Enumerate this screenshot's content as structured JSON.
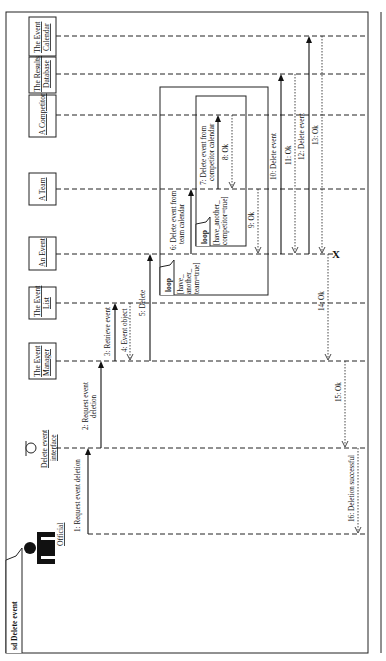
{
  "diagram": {
    "type": "UML sequence diagram",
    "orientation": "rotated 90° counter-clockwise",
    "frame_title": "sd Delete event",
    "lifelines": [
      {
        "id": "official",
        "label": "Official",
        "kind": "actor"
      },
      {
        "id": "interface",
        "label_line1": "Delete event",
        "label_line2": "interface",
        "kind": "boundary"
      },
      {
        "id": "manager",
        "label_line1": "The Event",
        "label_line2": "Manager",
        "kind": "object"
      },
      {
        "id": "list",
        "label_line1": "The Event",
        "label_line2": "List",
        "kind": "object"
      },
      {
        "id": "event",
        "label": "An Event",
        "kind": "object"
      },
      {
        "id": "team",
        "label": "A Team",
        "kind": "object"
      },
      {
        "id": "competitor",
        "label": "A Competitor",
        "kind": "object"
      },
      {
        "id": "results",
        "label_line1": "The Results",
        "label_line2": "Database",
        "kind": "object"
      },
      {
        "id": "calendar",
        "label_line1": "The Event",
        "label_line2": "Calendar",
        "kind": "object"
      }
    ],
    "messages": [
      {
        "n": 1,
        "label": "1: Request event deletion",
        "from": "official",
        "to": "interface",
        "type": "call"
      },
      {
        "n": 2,
        "label_line1": "2: Request event",
        "label_line2": "deletion",
        "from": "interface",
        "to": "manager",
        "type": "call"
      },
      {
        "n": 3,
        "label": "3: Retrieve event",
        "from": "manager",
        "to": "list",
        "type": "call"
      },
      {
        "n": 4,
        "label": "4: Event object",
        "from": "list",
        "to": "manager",
        "type": "return"
      },
      {
        "n": 5,
        "label": "5: Delete",
        "from": "manager",
        "to": "event",
        "type": "call"
      },
      {
        "n": 6,
        "label_line1": "6: Delete event from",
        "label_line2": "team calendar",
        "from": "event",
        "to": "team",
        "type": "call"
      },
      {
        "n": 7,
        "label_line1": "7: Delete event from",
        "label_line2": "competitor calendar",
        "from": "team",
        "to": "competitor",
        "type": "call"
      },
      {
        "n": 8,
        "label": "8: Ok",
        "from": "competitor",
        "to": "team",
        "type": "return"
      },
      {
        "n": 9,
        "label": "9: Ok",
        "from": "team",
        "to": "event",
        "type": "return"
      },
      {
        "n": 10,
        "label": "10: Delete event",
        "from": "event",
        "to": "results",
        "type": "call"
      },
      {
        "n": 11,
        "label": "11: Ok",
        "from": "results",
        "to": "event",
        "type": "return"
      },
      {
        "n": 12,
        "label": "12: Delete event",
        "from": "event",
        "to": "calendar",
        "type": "call"
      },
      {
        "n": 13,
        "label": "13: Ok",
        "from": "calendar",
        "to": "event",
        "type": "return"
      },
      {
        "n": 14,
        "label": "14: Ok",
        "from": "event",
        "to": "manager",
        "type": "return"
      },
      {
        "n": 15,
        "label": "15: Ok",
        "from": "manager",
        "to": "interface",
        "type": "return"
      },
      {
        "n": 16,
        "label": "16: Deletion successful",
        "from": "interface",
        "to": "official",
        "type": "return"
      }
    ],
    "fragments": [
      {
        "kind": "loop",
        "label": "loop",
        "guard_line1": "[have_",
        "guard_line2": "another_",
        "guard_line3": "team=true]"
      },
      {
        "kind": "loop",
        "label": "loop",
        "guard_line1": "[have_another_",
        "guard_line2": "competitor=true]"
      }
    ],
    "destroy_marker": "X"
  }
}
